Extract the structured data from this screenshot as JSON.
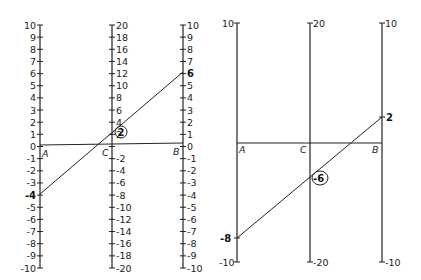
{
  "left_nomogram": {
    "axis_labels": {
      "A": "A",
      "C": "C",
      "B": "B"
    },
    "axis_A": {
      "min": -10,
      "max": 10,
      "step": 1,
      "ticks": [
        "10",
        "9",
        "8",
        "7",
        "6",
        "5",
        "4",
        "3",
        "2",
        "1",
        "0",
        "-1",
        "-2",
        "-3",
        "-4",
        "-5",
        "-6",
        "-7",
        "-8",
        "-9",
        "-10"
      ]
    },
    "axis_C": {
      "min": -20,
      "max": 20,
      "step": 2,
      "ticks": [
        "20",
        "18",
        "16",
        "14",
        "12",
        "10",
        "8",
        "6",
        "4",
        "2",
        "",
        "-2",
        "-4",
        "-6",
        "-8",
        "-10",
        "-12",
        "-14",
        "-16",
        "-18",
        "-20"
      ]
    },
    "axis_B": {
      "min": -10,
      "max": 10,
      "step": 1,
      "ticks": [
        "10",
        "9",
        "8",
        "7",
        "6",
        "5",
        "4",
        "3",
        "2",
        "1",
        "0",
        "-1",
        "-2",
        "-3",
        "-4",
        "-5",
        "-6",
        "-7",
        "-8",
        "-9",
        "-10"
      ]
    },
    "example": {
      "A_value": "-4",
      "B_value": "6",
      "C_result": "2"
    }
  },
  "right_nomogram": {
    "axis_labels": {
      "A": "A",
      "C": "C",
      "B": "B"
    },
    "axis_A": {
      "top": "10",
      "bottom": "-10"
    },
    "axis_C": {
      "top": "20",
      "bottom": "-20"
    },
    "axis_B": {
      "top": "10",
      "bottom": "-10"
    },
    "example": {
      "A_value": "-8",
      "B_value": "2",
      "C_result": "-6"
    }
  }
}
